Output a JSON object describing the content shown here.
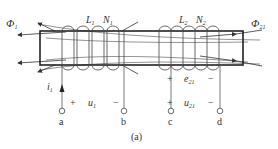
{
  "figure": {
    "caption": "(a)",
    "colors": {
      "line": "#333333",
      "thin": "#666666",
      "background": "#ffffff"
    },
    "flux": {
      "phi1": {
        "symbol": "Φ",
        "subscript": "1"
      },
      "phi21": {
        "symbol": "Φ",
        "subscript": "21"
      }
    },
    "coil1": {
      "inductance": "L",
      "inductance_sub": "1",
      "turns": "N",
      "turns_sub": "1",
      "loops": 5
    },
    "coil2": {
      "inductance": "L",
      "inductance_sub": "2",
      "turns": "N",
      "turns_sub": "2",
      "loops": 5
    },
    "current": {
      "symbol": "i",
      "subscript": "1"
    },
    "voltages": {
      "u1": {
        "symbol": "u",
        "subscript": "1",
        "plus": "+",
        "minus": "−"
      },
      "e21": {
        "symbol": "e",
        "subscript": "21",
        "plus": "+",
        "minus": "−"
      },
      "u21": {
        "symbol": "u",
        "subscript": "21",
        "plus": "+",
        "minus": "−"
      }
    },
    "terminals": [
      "a",
      "b",
      "c",
      "d"
    ]
  }
}
